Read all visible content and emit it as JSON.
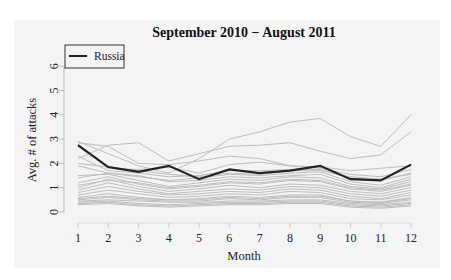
{
  "chart_data": {
    "type": "line",
    "title": "September 2010 − August 2011",
    "xlabel": "Month",
    "ylabel": "Avg. # of attacks",
    "x": [
      1,
      2,
      3,
      4,
      5,
      6,
      7,
      8,
      9,
      10,
      11,
      12
    ],
    "xticks": [
      "1",
      "2",
      "3",
      "4",
      "5",
      "6",
      "7",
      "8",
      "9",
      "10",
      "11",
      "12"
    ],
    "yticks": [
      "0",
      "1",
      "2",
      "3",
      "4",
      "5",
      "6"
    ],
    "ylim": [
      0,
      6.3
    ],
    "grid": false,
    "legend": {
      "position": "top-left",
      "entries": [
        "Russia"
      ]
    },
    "highlight_series": {
      "name": "Russia",
      "color": "#222222",
      "values": [
        2.75,
        1.85,
        1.65,
        1.9,
        1.35,
        1.75,
        1.6,
        1.7,
        1.9,
        1.35,
        1.3,
        1.95
      ]
    },
    "background_series_color": "#bdbdbd",
    "background_series": [
      {
        "values": [
          2.9,
          2.4,
          1.9,
          1.6,
          2.2,
          3.0,
          3.3,
          3.7,
          3.85,
          3.1,
          2.7,
          4.0
        ]
      },
      {
        "values": [
          2.2,
          2.75,
          2.85,
          2.1,
          2.4,
          2.7,
          2.75,
          2.85,
          2.5,
          2.2,
          2.35,
          3.3
        ]
      },
      {
        "values": [
          2.85,
          2.7,
          2.0,
          1.95,
          2.1,
          2.3,
          2.2,
          1.9,
          1.85,
          1.7,
          1.8,
          1.9
        ]
      },
      {
        "values": [
          2.7,
          1.8,
          1.75,
          1.85,
          1.6,
          1.95,
          2.05,
          1.9,
          1.8,
          1.55,
          1.45,
          1.75
        ]
      },
      {
        "values": [
          2.3,
          1.7,
          1.6,
          1.45,
          1.5,
          1.7,
          1.7,
          1.75,
          1.75,
          1.4,
          1.3,
          1.6
        ]
      },
      {
        "values": [
          1.9,
          1.6,
          1.45,
          1.3,
          1.4,
          1.55,
          1.5,
          1.6,
          1.65,
          1.25,
          1.1,
          1.45
        ]
      },
      {
        "values": [
          1.5,
          1.55,
          1.3,
          1.05,
          1.2,
          1.35,
          1.3,
          1.45,
          1.4,
          1.05,
          0.95,
          1.25
        ]
      },
      {
        "values": [
          1.2,
          1.45,
          1.15,
          0.95,
          1.05,
          1.2,
          1.15,
          1.3,
          1.25,
          0.95,
          0.85,
          1.1
        ]
      },
      {
        "values": [
          1.0,
          1.35,
          1.05,
          0.85,
          0.95,
          1.1,
          1.0,
          1.15,
          1.1,
          0.85,
          0.75,
          1.0
        ]
      },
      {
        "values": [
          0.9,
          1.2,
          0.95,
          0.75,
          0.85,
          0.95,
          0.9,
          1.05,
          1.0,
          0.75,
          0.65,
          0.9
        ]
      },
      {
        "values": [
          0.8,
          1.05,
          0.85,
          0.7,
          0.75,
          0.85,
          0.8,
          0.95,
          0.9,
          0.65,
          0.55,
          0.8
        ]
      },
      {
        "values": [
          0.7,
          0.9,
          0.75,
          0.6,
          0.65,
          0.75,
          0.7,
          0.85,
          0.8,
          0.55,
          0.5,
          0.7
        ]
      },
      {
        "values": [
          0.6,
          0.75,
          0.6,
          0.5,
          0.55,
          0.65,
          0.6,
          0.7,
          0.7,
          0.45,
          0.4,
          0.6
        ]
      },
      {
        "values": [
          0.5,
          0.6,
          0.5,
          0.45,
          0.45,
          0.55,
          0.5,
          0.6,
          0.6,
          0.4,
          0.35,
          0.5
        ]
      },
      {
        "values": [
          0.45,
          0.5,
          0.45,
          0.4,
          0.4,
          0.45,
          0.45,
          0.5,
          0.5,
          0.35,
          0.3,
          0.4
        ]
      },
      {
        "values": [
          0.4,
          0.45,
          0.35,
          0.3,
          0.35,
          0.4,
          0.4,
          0.45,
          0.45,
          0.3,
          0.25,
          0.35
        ]
      },
      {
        "values": [
          0.35,
          0.4,
          0.3,
          0.25,
          0.3,
          0.35,
          0.35,
          0.4,
          0.4,
          0.25,
          0.2,
          0.3
        ]
      },
      {
        "values": [
          0.3,
          0.35,
          0.25,
          0.2,
          0.25,
          0.3,
          0.3,
          0.35,
          0.35,
          0.2,
          0.15,
          0.25
        ]
      },
      {
        "values": [
          1.4,
          1.6,
          1.5,
          1.25,
          1.3,
          1.45,
          1.4,
          1.5,
          1.55,
          1.15,
          1.0,
          1.35
        ]
      },
      {
        "values": [
          1.1,
          1.3,
          1.2,
          1.0,
          1.1,
          1.25,
          1.2,
          1.35,
          1.3,
          1.0,
          0.9,
          1.15
        ]
      },
      {
        "values": [
          0.55,
          0.65,
          0.55,
          0.5,
          0.5,
          0.6,
          0.55,
          0.65,
          0.65,
          0.45,
          0.4,
          0.55
        ]
      },
      {
        "values": [
          2.0,
          1.85,
          1.7,
          1.55,
          1.45,
          1.6,
          1.55,
          1.7,
          1.7,
          1.45,
          1.35,
          1.55
        ]
      }
    ]
  }
}
